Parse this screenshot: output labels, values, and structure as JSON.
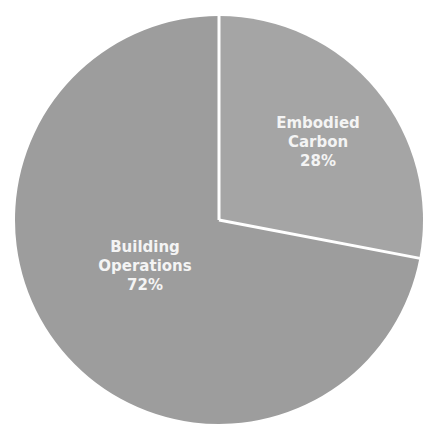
{
  "chart_data": {
    "type": "pie",
    "title": "",
    "start_angle_deg": 0,
    "direction": "clockwise",
    "slices": [
      {
        "label_lines": [
          "Embodied",
          "Carbon",
          "28%"
        ],
        "name": "Embodied Carbon",
        "value": 28,
        "color": "#a5a5a5"
      },
      {
        "label_lines": [
          "Building",
          "Operations",
          "72%"
        ],
        "name": "Building Operations",
        "value": 72,
        "color": "#9d9d9d"
      }
    ],
    "separator_color": "#ffffff",
    "legend": "none"
  }
}
